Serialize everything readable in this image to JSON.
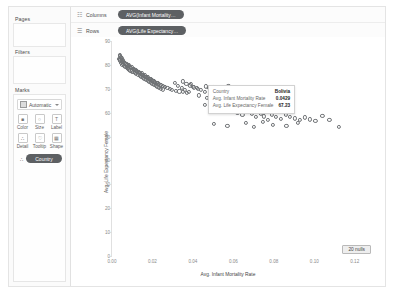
{
  "left_panel": {
    "pages_label": "Pages",
    "filters_label": "Filters",
    "marks_label": "Marks",
    "mark_type": "Automatic",
    "mark_type_icon": "square-mark-icon",
    "dropdown_icon": "chevron-down-icon",
    "buttons": [
      {
        "caption": "Color",
        "icon": "color-icon",
        "glyph": "■"
      },
      {
        "caption": "Size",
        "icon": "size-icon",
        "glyph": "○"
      },
      {
        "caption": "Label",
        "icon": "label-icon",
        "glyph": "T"
      },
      {
        "caption": "Detail",
        "icon": "detail-icon",
        "glyph": "∴"
      },
      {
        "caption": "Tooltip",
        "icon": "tooltip-icon",
        "glyph": "♡"
      },
      {
        "caption": "Shape",
        "icon": "shape-icon",
        "glyph": "▦"
      }
    ],
    "detail_pill": {
      "label": "Country",
      "icon": "detail-pill-icon",
      "glyph": "∴"
    }
  },
  "shelves": [
    {
      "name": "Columns",
      "icon": "columns-icon",
      "glyph": "☷",
      "pill": "AVG(Infant Mortality…"
    },
    {
      "name": "Rows",
      "icon": "rows-icon",
      "glyph": "☰",
      "pill": "AVG(Life Expectancy…"
    }
  ],
  "nulls_badge": "20 nulls",
  "tooltip": {
    "rows": [
      {
        "key": "Country",
        "value": "Bolivia"
      },
      {
        "key": "Avg. Infant Mortality Rate",
        "value": "0.0429"
      },
      {
        "key": "Avg. Life Expectancy Female",
        "value": "67.23"
      }
    ]
  },
  "colors": {
    "pill": "#5d6063",
    "mark_outline": "#6f7275",
    "axis": "#8a8a8a"
  },
  "chart_data": {
    "type": "scatter",
    "title": "",
    "xlabel": "Avg. Infant Mortality Rate",
    "ylabel": "Avg. Life Expectancy Female",
    "xlim": [
      0.0,
      0.13
    ],
    "ylim": [
      0,
      90
    ],
    "xticks": [
      0.0,
      0.02,
      0.04,
      0.06,
      0.08,
      0.1,
      0.12
    ],
    "xticklabels": [
      "0.00",
      "0.02",
      "0.04",
      "0.06",
      "0.08",
      "0.10",
      "0.12"
    ],
    "yticks": [
      0,
      10,
      20,
      30,
      40,
      50,
      60,
      70,
      80,
      90
    ],
    "yticklabels": [
      "0",
      "10",
      "20",
      "30",
      "40",
      "50",
      "60",
      "70",
      "80",
      "90"
    ],
    "grid": false,
    "legend": false,
    "marker": "open-circle",
    "highlighted_point": {
      "label": "Bolivia",
      "x": 0.0429,
      "y": 67.23
    },
    "points": [
      [
        0.0041,
        84.2
      ],
      [
        0.0039,
        83.6
      ],
      [
        0.0044,
        83.1
      ],
      [
        0.0047,
        82.9
      ],
      [
        0.0036,
        82.6
      ],
      [
        0.0042,
        82.3
      ],
      [
        0.0051,
        82.1
      ],
      [
        0.0038,
        81.9
      ],
      [
        0.0055,
        81.7
      ],
      [
        0.0049,
        81.4
      ],
      [
        0.0058,
        81.2
      ],
      [
        0.0045,
        81.0
      ],
      [
        0.0062,
        80.8
      ],
      [
        0.0053,
        80.6
      ],
      [
        0.0067,
        80.4
      ],
      [
        0.0071,
        80.2
      ],
      [
        0.0048,
        80.0
      ],
      [
        0.0075,
        79.8
      ],
      [
        0.006,
        79.6
      ],
      [
        0.0081,
        79.5
      ],
      [
        0.0066,
        79.3
      ],
      [
        0.0088,
        79.1
      ],
      [
        0.0073,
        78.9
      ],
      [
        0.0094,
        78.7
      ],
      [
        0.0079,
        78.5
      ],
      [
        0.0102,
        78.3
      ],
      [
        0.0085,
        78.1
      ],
      [
        0.011,
        77.9
      ],
      [
        0.0091,
        77.7
      ],
      [
        0.0118,
        77.5
      ],
      [
        0.0098,
        77.3
      ],
      [
        0.0125,
        77.1
      ],
      [
        0.0106,
        76.9
      ],
      [
        0.0133,
        76.7
      ],
      [
        0.0113,
        76.5
      ],
      [
        0.0141,
        76.3
      ],
      [
        0.012,
        76.1
      ],
      [
        0.0149,
        75.9
      ],
      [
        0.0128,
        75.7
      ],
      [
        0.0157,
        75.5
      ],
      [
        0.0136,
        75.3
      ],
      [
        0.0165,
        75.1
      ],
      [
        0.0144,
        74.9
      ],
      [
        0.0173,
        74.7
      ],
      [
        0.0152,
        74.5
      ],
      [
        0.0181,
        74.3
      ],
      [
        0.016,
        74.1
      ],
      [
        0.0189,
        73.9
      ],
      [
        0.0168,
        73.7
      ],
      [
        0.0197,
        73.5
      ],
      [
        0.0176,
        73.3
      ],
      [
        0.0205,
        73.1
      ],
      [
        0.0184,
        72.9
      ],
      [
        0.0213,
        72.7
      ],
      [
        0.0192,
        72.5
      ],
      [
        0.0221,
        72.3
      ],
      [
        0.02,
        72.1
      ],
      [
        0.023,
        71.9
      ],
      [
        0.0208,
        71.7
      ],
      [
        0.024,
        71.5
      ],
      [
        0.0216,
        71.3
      ],
      [
        0.025,
        71.1
      ],
      [
        0.0224,
        70.9
      ],
      [
        0.0262,
        70.7
      ],
      [
        0.0232,
        70.5
      ],
      [
        0.0274,
        70.3
      ],
      [
        0.0241,
        70.1
      ],
      [
        0.0286,
        69.9
      ],
      [
        0.025,
        69.7
      ],
      [
        0.0298,
        69.5
      ],
      [
        0.0116,
        78.0
      ],
      [
        0.0131,
        77.2
      ],
      [
        0.0146,
        76.4
      ],
      [
        0.0161,
        75.6
      ],
      [
        0.0177,
        74.8
      ],
      [
        0.0193,
        74.0
      ],
      [
        0.0209,
        73.2
      ],
      [
        0.0226,
        72.4
      ],
      [
        0.0243,
        71.6
      ],
      [
        0.0261,
        70.8
      ],
      [
        0.0084,
        79.9
      ],
      [
        0.0096,
        79.0
      ],
      [
        0.0108,
        78.2
      ],
      [
        0.0122,
        77.4
      ],
      [
        0.0138,
        76.6
      ],
      [
        0.0154,
        75.8
      ],
      [
        0.017,
        75.0
      ],
      [
        0.0187,
        74.2
      ],
      [
        0.0204,
        73.4
      ],
      [
        0.0222,
        72.6
      ],
      [
        0.0315,
        69.2
      ],
      [
        0.0333,
        68.9
      ],
      [
        0.0352,
        68.6
      ],
      [
        0.0371,
        68.3
      ],
      [
        0.039,
        71.9
      ],
      [
        0.031,
        72.6
      ],
      [
        0.0326,
        71.1
      ],
      [
        0.0344,
        70.4
      ],
      [
        0.0362,
        69.6
      ],
      [
        0.0381,
        68.8
      ],
      [
        0.04,
        70.9
      ],
      [
        0.0418,
        70.2
      ],
      [
        0.0429,
        67.23
      ],
      [
        0.044,
        69.4
      ],
      [
        0.0458,
        68.7
      ],
      [
        0.0352,
        73.1
      ],
      [
        0.0368,
        72.2
      ],
      [
        0.0385,
        71.4
      ],
      [
        0.0404,
        70.6
      ],
      [
        0.0424,
        69.8
      ],
      [
        0.0466,
        71.0
      ],
      [
        0.0478,
        70.3
      ],
      [
        0.049,
        69.1
      ],
      [
        0.0505,
        70.7
      ],
      [
        0.052,
        69.9
      ],
      [
        0.054,
        70.1
      ],
      [
        0.0558,
        69.3
      ],
      [
        0.0575,
        71.2
      ],
      [
        0.06,
        70.5
      ],
      [
        0.0625,
        69.0
      ],
      [
        0.047,
        66.2
      ],
      [
        0.0498,
        65.4
      ],
      [
        0.053,
        64.8
      ],
      [
        0.056,
        63.2
      ],
      [
        0.059,
        62.4
      ],
      [
        0.062,
        59.8
      ],
      [
        0.0645,
        58.9
      ],
      [
        0.0665,
        60.2
      ],
      [
        0.069,
        59.4
      ],
      [
        0.0712,
        58.2
      ],
      [
        0.0735,
        59.6
      ],
      [
        0.0752,
        58.4
      ],
      [
        0.077,
        57.1
      ],
      [
        0.079,
        59.0
      ],
      [
        0.0812,
        58.1
      ],
      [
        0.0836,
        57.4
      ],
      [
        0.0858,
        59.2
      ],
      [
        0.088,
        58.3
      ],
      [
        0.0905,
        57.6
      ],
      [
        0.093,
        56.8
      ],
      [
        0.0955,
        58.0
      ],
      [
        0.098,
        57.2
      ],
      [
        0.1005,
        56.4
      ],
      [
        0.104,
        58.6
      ],
      [
        0.1075,
        57.0
      ],
      [
        0.112,
        53.9
      ],
      [
        0.0505,
        55.2
      ],
      [
        0.057,
        54.6
      ],
      [
        0.066,
        55.8
      ],
      [
        0.07,
        54.2
      ],
      [
        0.0745,
        56.1
      ],
      [
        0.0795,
        55.0
      ],
      [
        0.0862,
        54.4
      ],
      [
        0.0918,
        55.6
      ],
      [
        0.064,
        63.8
      ],
      [
        0.068,
        64.6
      ],
      [
        0.072,
        63.0
      ],
      [
        0.054,
        61.5
      ],
      [
        0.058,
        62.8
      ],
      [
        0.046,
        63.4
      ]
    ]
  }
}
